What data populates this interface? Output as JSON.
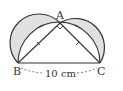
{
  "figure": {
    "points": {
      "A": {
        "label": "A",
        "x": 60,
        "y": 23
      },
      "B": {
        "label": "B",
        "x": 18,
        "y": 63
      },
      "C": {
        "label": "C",
        "x": 100,
        "y": 63
      }
    },
    "dimension_label": "10 cm",
    "right_angle_at": "A",
    "equal_side_marks": [
      "AB",
      "AC"
    ],
    "shaded_regions": "lunes between semicircles on AB, AC and arc BC",
    "colors": {
      "stroke": "#333333",
      "shade": "#e0e0e0",
      "background": "#ffffff"
    }
  }
}
